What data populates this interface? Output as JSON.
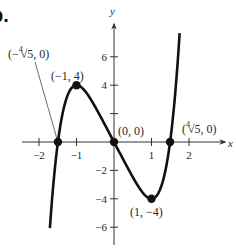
{
  "part_label": "b.",
  "chart_data": {
    "type": "line",
    "title": "",
    "function": "f(x) = x^5 - 5x",
    "xlabel": "x",
    "ylabel": "y",
    "xlim": [
      -2.4,
      2.9
    ],
    "ylim": [
      -7,
      8
    ],
    "x_ticks": [
      -2,
      -1,
      1,
      2
    ],
    "x_tick_labels": [
      "−2",
      "−1",
      "1",
      "2"
    ],
    "y_ticks": [
      6,
      4,
      2,
      -2,
      -4,
      -6
    ],
    "y_tick_labels": [
      "6",
      "4",
      "",
      "−2",
      "−4",
      "−6"
    ],
    "grid": false,
    "series": [
      {
        "name": "curve",
        "x": [
          -1.71,
          -1.6,
          -1.5,
          -1.4,
          -1.3,
          -1.2,
          -1.1,
          -1.0,
          -0.9,
          -0.8,
          -0.6,
          -0.4,
          -0.2,
          0.0,
          0.2,
          0.4,
          0.6,
          0.8,
          0.9,
          1.0,
          1.1,
          1.2,
          1.3,
          1.4,
          1.5,
          1.6,
          1.75
        ],
        "y": [
          -6.09,
          -2.49,
          -0.09,
          1.62,
          2.79,
          3.51,
          3.89,
          4.0,
          3.91,
          3.67,
          2.92,
          1.99,
          1.0,
          0.0,
          -1.0,
          -1.99,
          -2.92,
          -3.67,
          -3.91,
          -4.0,
          -3.89,
          -3.51,
          -2.79,
          -1.62,
          0.09,
          2.49,
          7.66
        ]
      }
    ],
    "points": [
      {
        "x": -1.495,
        "y": 0,
        "label": "(−⁴√5, 0)"
      },
      {
        "x": -1,
        "y": 4,
        "label": "(−1, 4)"
      },
      {
        "x": 0,
        "y": 0,
        "label": "(0, 0)"
      },
      {
        "x": 1,
        "y": -4,
        "label": "(1, −4)"
      },
      {
        "x": 1.495,
        "y": 0,
        "label": "(⁴√5, 0)"
      }
    ]
  },
  "labels": {
    "neg_root": {
      "open": "(−",
      "idx": "4",
      "rad": "√5, 0)"
    },
    "pos_root": {
      "open": "(",
      "idx": "4",
      "rad": "√5, 0)"
    },
    "max": "(−1, 4)",
    "origin": "(0, 0)",
    "min": "(1, −4)"
  },
  "colors": {
    "curve": "#111111",
    "axis": "#333333",
    "text": "#2a2a2a"
  }
}
